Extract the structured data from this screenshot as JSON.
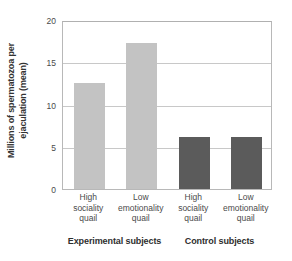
{
  "chart_data": {
    "type": "bar",
    "title": "",
    "xlabel": "",
    "ylabel": "Millions of spermatozoa per ejaculation (mean)",
    "ylabel_line1": "Millions of spermatozoa per",
    "ylabel_line2": "ejaculation (mean)",
    "ylim": [
      0,
      20
    ],
    "yticks": [
      0,
      5,
      10,
      15,
      20
    ],
    "ytick_labels": [
      "0",
      "5",
      "10",
      "15",
      "20"
    ],
    "grid": true,
    "grid_axis": "y",
    "legend": "none",
    "categories": [
      "High sociality quail",
      "Low emotionality quail",
      "High sociality quail",
      "Low emotionality quail"
    ],
    "category_lines": [
      [
        "High",
        "sociality",
        "quail"
      ],
      [
        "Low",
        "emotionality",
        "quail"
      ],
      [
        "High",
        "sociality",
        "quail"
      ],
      [
        "Low",
        "emotionality",
        "quail"
      ]
    ],
    "values": [
      12.5,
      17.3,
      6.2,
      6.1
    ],
    "bar_colors": [
      "#c3c3c3",
      "#c3c3c3",
      "#5b5b5b",
      "#5b5b5b"
    ],
    "groups": [
      {
        "label": "Experimental subjects",
        "categories": [
          0,
          1
        ],
        "color": "#c3c3c3"
      },
      {
        "label": "Control subjects",
        "categories": [
          2,
          3
        ],
        "color": "#5b5b5b"
      }
    ],
    "series": [
      {
        "name": "Millions of spermatozoa per ejaculation (mean)",
        "values": [
          12.5,
          17.3,
          6.2,
          6.1
        ]
      }
    ]
  },
  "colors": {
    "experimental_bar": "#c3c3c3",
    "control_bar": "#5b5b5b",
    "gridline": "#c8c8c8",
    "frame": "#b8b8b8",
    "text": "#4a4a4a",
    "background": "#ffffff"
  }
}
